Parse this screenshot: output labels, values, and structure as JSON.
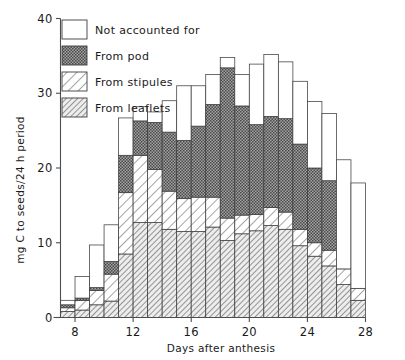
{
  "chart_data": {
    "type": "bar",
    "subtype": "stacked-bar-histogram",
    "title": "",
    "xlabel": "Days after anthesis",
    "ylabel": "mg C to seeds/24 h period",
    "xlim": [
      7,
      28
    ],
    "ylim": [
      0,
      40
    ],
    "xticks": [
      8,
      12,
      16,
      20,
      24,
      28
    ],
    "yticks": [
      0,
      10,
      20,
      30,
      40
    ],
    "grid": false,
    "legend_position": "top-left",
    "bar_width_days": 1,
    "categories": [
      7,
      8,
      9,
      10,
      11,
      12,
      13,
      14,
      15,
      16,
      17,
      18,
      19,
      20,
      21,
      22,
      23,
      24,
      25,
      26,
      27
    ],
    "series": [
      {
        "name": "From leaflets",
        "fill": "hatch-leaflets",
        "values": [
          0.8,
          1.0,
          1.7,
          2.2,
          8.5,
          12.7,
          12.7,
          11.8,
          11.5,
          11.5,
          12.1,
          10.3,
          11.2,
          11.6,
          12.3,
          11.8,
          9.6,
          8.2,
          6.9,
          4.4,
          2.3
        ]
      },
      {
        "name": "From stipules",
        "fill": "hatch-stipules",
        "values": [
          0.5,
          1.3,
          1.9,
          3.6,
          8.2,
          9.0,
          7.1,
          5.1,
          4.4,
          4.6,
          4.0,
          3.0,
          2.5,
          2.2,
          2.4,
          2.3,
          2.2,
          1.8,
          2.1,
          2.1,
          1.6
        ]
      },
      {
        "name": "From pod",
        "fill": "dots-pod",
        "values": [
          0.4,
          0.3,
          0.4,
          1.7,
          5.0,
          4.6,
          6.3,
          7.9,
          7.8,
          9.5,
          12.4,
          20.1,
          14.6,
          12.0,
          12.2,
          12.5,
          11.4,
          10.0,
          9.3,
          0.0,
          0.0
        ]
      },
      {
        "name": "Not accounted for",
        "fill": "open-white",
        "values": [
          0.6,
          2.9,
          5.7,
          4.9,
          5.0,
          1.9,
          1.4,
          4.2,
          7.3,
          5.4,
          4.0,
          1.4,
          4.2,
          8.1,
          8.3,
          7.6,
          8.4,
          8.9,
          9.0,
          14.6,
          14.1
        ]
      }
    ],
    "totals": [
      2.3,
      5.5,
      9.7,
      12.4,
      26.7,
      28.2,
      27.5,
      29.0,
      31.0,
      31.0,
      32.5,
      34.8,
      32.5,
      33.9,
      35.2,
      34.2,
      31.6,
      28.9,
      27.3,
      21.1,
      18.0
    ]
  },
  "legend": {
    "items": [
      {
        "label": "Not accounted for",
        "swatch": "open-white"
      },
      {
        "label": "From pod",
        "swatch": "dots-pod"
      },
      {
        "label": "From stipules",
        "swatch": "hatch-stipules"
      },
      {
        "label": "From leaflets",
        "swatch": "hatch-leaflets"
      }
    ]
  },
  "axes": {
    "x_title": "Days after anthesis",
    "y_title": "mg C to seeds/24 h period",
    "x_tick_labels": [
      "8",
      "12",
      "16",
      "20",
      "24",
      "28"
    ],
    "y_tick_labels": [
      "0",
      "10",
      "20",
      "30",
      "40"
    ]
  },
  "colors": {
    "ink": "#1a1a1a",
    "axis": "#4d4d4d",
    "bar_outline": "#3d3d3d",
    "background": "#ffffff",
    "pod_fill": "#8f8f8f",
    "stipules_fill": "#ffffff",
    "leaflets_fill": "#e8e8e8"
  }
}
